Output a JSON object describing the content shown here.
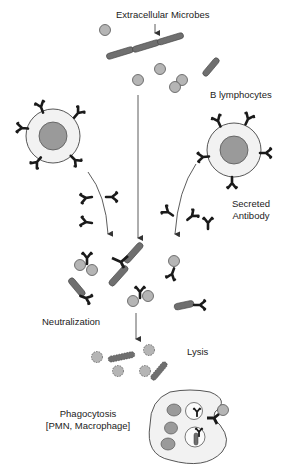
{
  "labels": {
    "extracellular_microbes": "Extracellular Microbes",
    "b_lymphocytes": "B lymphocytes",
    "secreted_antibody_line1": "Secreted",
    "secreted_antibody_line2": "Antibody",
    "neutralization": "Neutralization",
    "lysis": "Lysis",
    "phagocytosis_line1": "Phagocytosis",
    "phagocytosis_line2": "[PMN, Macrophage]"
  },
  "colors": {
    "microbe_fill": "#b5b5b5",
    "rod_fill": "#6f6f6f",
    "antibody": "#1a1a1a",
    "cell_fill": "#f2f2f2",
    "nucleus_fill": "#9a9a9a",
    "line": "#333333"
  }
}
